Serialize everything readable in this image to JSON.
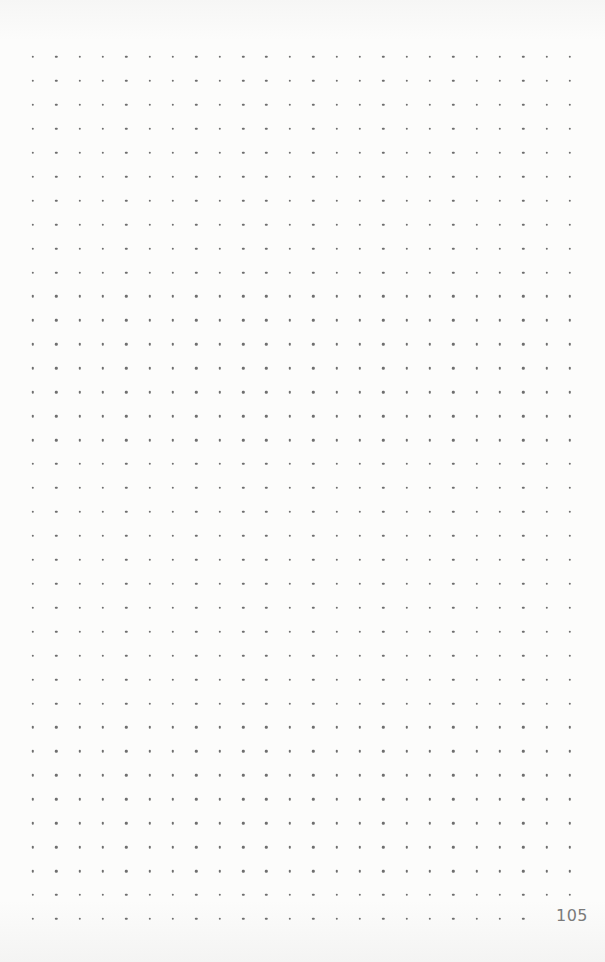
{
  "page": {
    "type": "dot-grid notebook page",
    "page_number": "105",
    "grid": {
      "columns": 24,
      "rows": 37,
      "last_row_dots": 22,
      "dot_color": "#6e6e6e"
    },
    "colors": {
      "paper": "#fbfbfa",
      "text": "#7a7a7a"
    }
  }
}
